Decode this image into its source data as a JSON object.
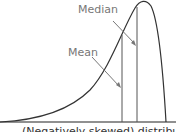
{
  "diagram": {
    "labels": {
      "median": "Median",
      "mean": "Mean"
    },
    "caption": "(Negatively skewed) distribution",
    "colors": {
      "curve": "#333333",
      "lines": "#555555",
      "label": "#777777"
    }
  }
}
